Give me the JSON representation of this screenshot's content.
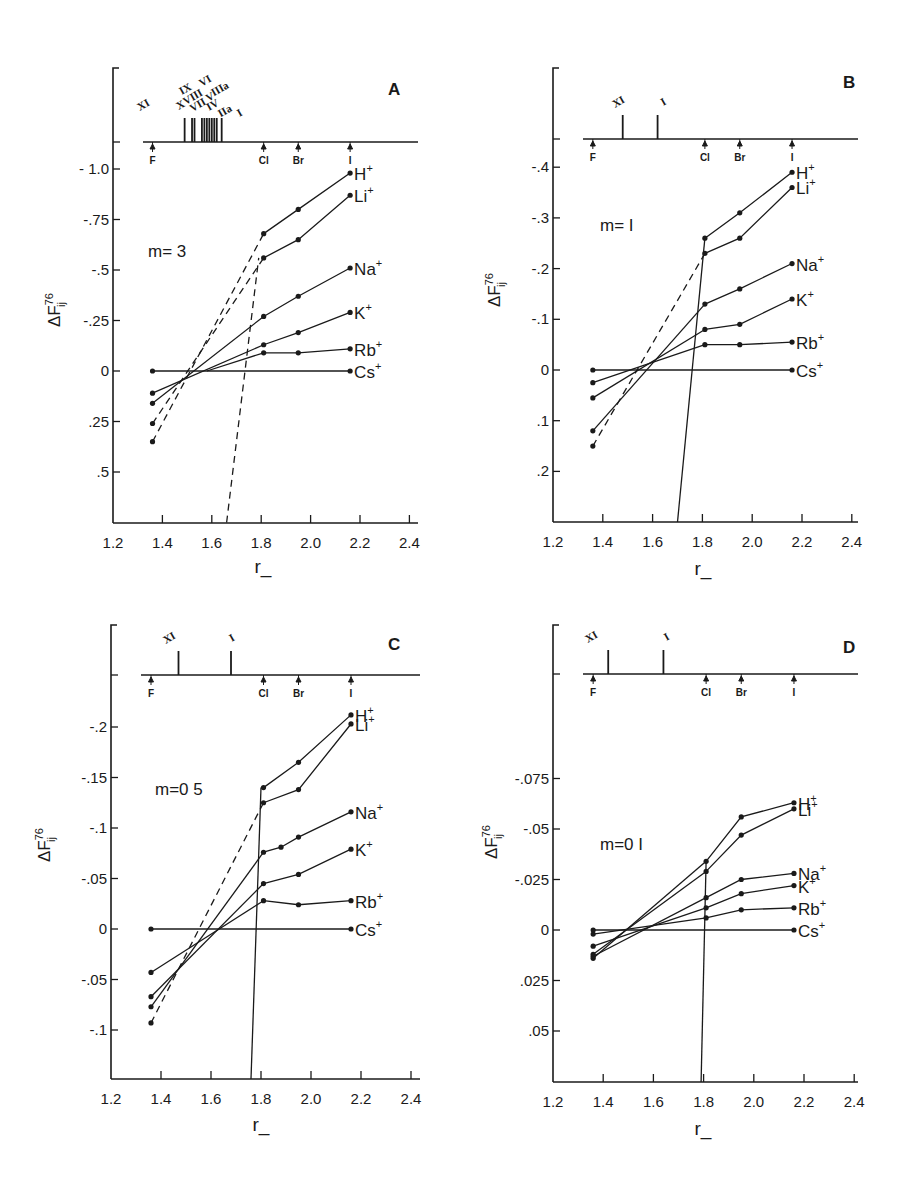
{
  "figure": {
    "title": "",
    "ylabel": "ΔF_ij^76",
    "xlabel": "r_"
  },
  "chart_data": [
    {
      "panel": "A",
      "type": "line",
      "annotation": "m= 3",
      "xlabel": "r_",
      "ylabel": "ΔF_ij^76",
      "x_ticks": [
        "1.2",
        "1.4",
        "1.6",
        "1.8",
        "2.0",
        "2.2",
        "2.4"
      ],
      "y_ticks": [
        {
          "v": -1.0,
          "label": "- 1.0"
        },
        {
          "v": -0.75,
          "label": "-.75"
        },
        {
          "v": -0.5,
          "label": "-.5"
        },
        {
          "v": -0.25,
          "label": "-.25"
        },
        {
          "v": 0,
          "label": "0"
        },
        {
          "v": 0.25,
          "label": ".25"
        },
        {
          "v": 0.5,
          "label": ".5"
        }
      ],
      "xlim": [
        1.2,
        2.46
      ],
      "ylim": [
        -1.0,
        0.75
      ],
      "y_inverted": true,
      "halide_markers": [
        {
          "label": "F",
          "x": 1.36
        },
        {
          "label": "Cl",
          "x": 1.81
        },
        {
          "label": "Br",
          "x": 1.95
        },
        {
          "label": "I",
          "x": 2.16
        }
      ],
      "roman_markers": [
        {
          "label": "XI",
          "x": 1.33,
          "pos": "low"
        },
        {
          "label": "X",
          "x": 1.48,
          "pos": "low"
        },
        {
          "label": "IX",
          "x": 1.5,
          "pos": "high"
        },
        {
          "label": "VIII",
          "x": 1.53,
          "pos": "mid"
        },
        {
          "label": "VII",
          "x": 1.55,
          "pos": "low"
        },
        {
          "label": "VI",
          "x": 1.58,
          "pos": "top"
        },
        {
          "label": "V",
          "x": 1.6,
          "pos": "mid"
        },
        {
          "label": "IV",
          "x": 1.61,
          "pos": "low"
        },
        {
          "label": "IIIa",
          "x": 1.64,
          "pos": "high"
        },
        {
          "label": "IIa",
          "x": 1.66,
          "pos": "low2"
        },
        {
          "label": "I",
          "x": 1.72,
          "pos": "lower"
        }
      ],
      "eisenman_lines_x": [
        1.49,
        1.52,
        1.53,
        1.56,
        1.57,
        1.58,
        1.59,
        1.6,
        1.61,
        1.62,
        1.64
      ],
      "series": [
        {
          "name": "H+",
          "ion": "H",
          "x": [
            1.81,
            1.95,
            2.16
          ],
          "y": [
            -0.68,
            -0.8,
            -0.98
          ],
          "ext_dashed": [
            [
              1.36,
              0.35
            ],
            [
              1.81,
              -0.68
            ]
          ]
        },
        {
          "name": "Li+",
          "ion": "Li",
          "x": [
            1.81,
            1.95,
            2.16
          ],
          "y": [
            -0.56,
            -0.65,
            -0.87
          ],
          "ext_dashed": [
            [
              1.36,
              0.26
            ],
            [
              1.81,
              -0.56
            ]
          ]
        },
        {
          "name": "Na+",
          "ion": "Na",
          "x": [
            1.81,
            1.95,
            2.16
          ],
          "y": [
            -0.27,
            -0.37,
            -0.51
          ],
          "ext_solid": [
            [
              1.36,
              0.16
            ],
            [
              1.81,
              -0.27
            ]
          ]
        },
        {
          "name": "K+",
          "ion": "K",
          "x": [
            1.81,
            1.95,
            2.16
          ],
          "y": [
            -0.13,
            -0.19,
            -0.29
          ],
          "ext_solid": [
            [
              1.36,
              0.11
            ],
            [
              1.81,
              -0.13
            ]
          ]
        },
        {
          "name": "Rb+",
          "ion": "Rb",
          "x": [
            1.81,
            1.95,
            2.16
          ],
          "y": [
            -0.09,
            -0.09,
            -0.11
          ],
          "ext_solid": [
            [
              1.58,
              0.0
            ],
            [
              1.81,
              -0.09
            ]
          ]
        },
        {
          "name": "Cs+",
          "ion": "Cs",
          "x": [
            1.36,
            2.16
          ],
          "y": [
            0,
            0
          ]
        }
      ],
      "cross_line": {
        "style": "dashed",
        "from": [
          1.66,
          0.75
        ],
        "to": [
          1.79,
          -0.56
        ]
      }
    },
    {
      "panel": "B",
      "type": "line",
      "annotation": "m= I",
      "xlabel": "r_",
      "ylabel": "ΔF_ij^76",
      "x_ticks": [
        "1.2",
        "1.4",
        "1.6",
        "1.8",
        "2.0",
        "2.2",
        "2.4"
      ],
      "y_ticks": [
        {
          "v": -0.4,
          "label": "-.4"
        },
        {
          "v": -0.3,
          "label": "-.3"
        },
        {
          "v": -0.2,
          "label": "-.2"
        },
        {
          "v": -0.1,
          "label": "-.1"
        },
        {
          "v": 0,
          "label": "0"
        },
        {
          "v": 0.1,
          "label": ".1"
        },
        {
          "v": 0.2,
          "label": ".2"
        }
      ],
      "xlim": [
        1.2,
        2.46
      ],
      "ylim": [
        -0.4,
        0.3
      ],
      "y_inverted": true,
      "halide_markers": [
        {
          "label": "F",
          "x": 1.36
        },
        {
          "label": "Cl",
          "x": 1.81
        },
        {
          "label": "Br",
          "x": 1.95
        },
        {
          "label": "I",
          "x": 2.16
        }
      ],
      "roman_markers": [
        {
          "label": "XI",
          "x": 1.47,
          "pos": "low"
        },
        {
          "label": "I",
          "x": 1.65,
          "pos": "low"
        }
      ],
      "eisenman_lines_x": [
        1.48,
        1.62
      ],
      "series": [
        {
          "name": "H+",
          "ion": "H",
          "x": [
            1.81,
            1.95,
            2.16
          ],
          "y": [
            -0.26,
            -0.31,
            -0.39
          ]
        },
        {
          "name": "Li+",
          "ion": "Li",
          "x": [
            1.81,
            1.95,
            2.16
          ],
          "y": [
            -0.23,
            -0.26,
            -0.36
          ],
          "ext_dashed": [
            [
              1.36,
              0.15
            ],
            [
              1.81,
              -0.23
            ]
          ]
        },
        {
          "name": "Na+",
          "ion": "Na",
          "x": [
            1.81,
            1.95,
            2.16
          ],
          "y": [
            -0.13,
            -0.16,
            -0.21
          ],
          "ext_solid": [
            [
              1.36,
              0.12
            ],
            [
              1.81,
              -0.13
            ]
          ]
        },
        {
          "name": "K+",
          "ion": "K",
          "x": [
            1.81,
            1.95,
            2.16
          ],
          "y": [
            -0.08,
            -0.09,
            -0.14
          ],
          "ext_solid": [
            [
              1.36,
              0.055
            ],
            [
              1.81,
              -0.08
            ]
          ]
        },
        {
          "name": "Rb+",
          "ion": "Rb",
          "x": [
            1.81,
            1.95,
            2.16
          ],
          "y": [
            -0.05,
            -0.05,
            -0.055
          ],
          "ext_solid": [
            [
              1.36,
              0.025
            ],
            [
              1.81,
              -0.05
            ]
          ]
        },
        {
          "name": "Cs+",
          "ion": "Cs",
          "x": [
            1.36,
            2.16
          ],
          "y": [
            0,
            0
          ]
        }
      ],
      "cross_line": {
        "style": "solid",
        "from": [
          1.7,
          0.3
        ],
        "to": [
          1.81,
          -0.26
        ]
      }
    },
    {
      "panel": "C",
      "type": "line",
      "annotation": "m=0 5",
      "xlabel": "r_",
      "ylabel": "ΔF_ij^76",
      "x_ticks": [
        "1.2",
        "1.4",
        "1.6",
        "1.8",
        "2.0",
        "2.2",
        "2.4"
      ],
      "y_ticks": [
        {
          "v": -0.2,
          "label": "-.2"
        },
        {
          "v": -0.15,
          "label": "-.15"
        },
        {
          "v": -0.1,
          "label": "-.1"
        },
        {
          "v": -0.05,
          "label": "-.05"
        },
        {
          "v": 0,
          "label": "0"
        },
        {
          "v": 0.05,
          "label": "-.05"
        },
        {
          "v": 0.1,
          "label": "-.1"
        }
      ],
      "xlim": [
        1.2,
        2.46
      ],
      "ylim": [
        -0.2,
        0.15
      ],
      "y_inverted": true,
      "halide_markers": [
        {
          "label": "F",
          "x": 1.36
        },
        {
          "label": "Cl",
          "x": 1.81
        },
        {
          "label": "Br",
          "x": 1.95
        },
        {
          "label": "I",
          "x": 2.16
        }
      ],
      "roman_markers": [
        {
          "label": "XI",
          "x": 1.44,
          "pos": "low"
        },
        {
          "label": "I",
          "x": 1.69,
          "pos": "low"
        }
      ],
      "eisenman_lines_x": [
        1.47,
        1.68
      ],
      "series": [
        {
          "name": "H+",
          "ion": "H",
          "x": [
            1.81,
            1.95,
            2.16
          ],
          "y": [
            -0.14,
            -0.165,
            -0.212
          ]
        },
        {
          "name": "Li+",
          "ion": "Li",
          "x": [
            1.81,
            1.95,
            2.16
          ],
          "y": [
            -0.125,
            -0.138,
            -0.203
          ],
          "ext_dashed": [
            [
              1.36,
              0.093
            ],
            [
              1.81,
              -0.125
            ]
          ]
        },
        {
          "name": "Na+",
          "ion": "Na",
          "x": [
            1.81,
            1.88,
            1.95,
            2.16
          ],
          "y": [
            -0.076,
            -0.081,
            -0.091,
            -0.116
          ],
          "ext_solid": [
            [
              1.36,
              0.077
            ],
            [
              1.81,
              -0.076
            ]
          ]
        },
        {
          "name": "K+",
          "ion": "K",
          "x": [
            1.81,
            1.95,
            2.16
          ],
          "y": [
            -0.045,
            -0.054,
            -0.079
          ],
          "ext_solid": [
            [
              1.36,
              0.067
            ],
            [
              1.81,
              -0.045
            ]
          ]
        },
        {
          "name": "Rb+",
          "ion": "Rb",
          "x": [
            1.81,
            1.95,
            2.16
          ],
          "y": [
            -0.028,
            -0.024,
            -0.028
          ],
          "ext_solid": [
            [
              1.36,
              0.043
            ],
            [
              1.81,
              -0.028
            ]
          ]
        },
        {
          "name": "Cs+",
          "ion": "Cs",
          "x": [
            1.36,
            2.16
          ],
          "y": [
            0,
            0
          ]
        }
      ],
      "cross_line": {
        "style": "solid",
        "from": [
          1.76,
          0.15
        ],
        "to": [
          1.8,
          -0.14
        ]
      }
    },
    {
      "panel": "D",
      "type": "line",
      "annotation": "m=0 I",
      "xlabel": "r_",
      "ylabel": "ΔF_ij^76",
      "x_ticks": [
        "1.2",
        "1.4",
        "1.6",
        "1.8",
        "2.0",
        "2.2",
        "2.4"
      ],
      "y_ticks": [
        {
          "v": -0.075,
          "label": "-.075"
        },
        {
          "v": -0.05,
          "label": "-.05"
        },
        {
          "v": -0.025,
          "label": "-.025"
        },
        {
          "v": 0,
          "label": "0"
        },
        {
          "v": 0.025,
          "label": ".025"
        },
        {
          "v": 0.05,
          "label": ".05"
        }
      ],
      "xlim": [
        1.2,
        2.46
      ],
      "ylim": [
        -0.1,
        0.075
      ],
      "y_inverted": true,
      "halide_markers": [
        {
          "label": "F",
          "x": 1.36
        },
        {
          "label": "Cl",
          "x": 1.81
        },
        {
          "label": "Br",
          "x": 1.95
        },
        {
          "label": "I",
          "x": 2.16
        }
      ],
      "roman_markers": [
        {
          "label": "XI",
          "x": 1.36,
          "pos": "low"
        },
        {
          "label": "I",
          "x": 1.66,
          "pos": "low"
        }
      ],
      "eisenman_lines_x": [
        1.42,
        1.64
      ],
      "series": [
        {
          "name": "H+",
          "ion": "H",
          "x": [
            1.81,
            1.95,
            2.16
          ],
          "y": [
            -0.034,
            -0.056,
            -0.063
          ],
          "ext_solid": [
            [
              1.36,
              0.014
            ],
            [
              1.81,
              -0.034
            ]
          ]
        },
        {
          "name": "Li+",
          "ion": "Li",
          "x": [
            1.81,
            1.95,
            2.16
          ],
          "y": [
            -0.029,
            -0.047,
            -0.06
          ],
          "ext_solid": [
            [
              1.36,
              0.012
            ],
            [
              1.81,
              -0.029
            ]
          ]
        },
        {
          "name": "Na+",
          "ion": "Na",
          "x": [
            1.81,
            1.95,
            2.16
          ],
          "y": [
            -0.016,
            -0.025,
            -0.028
          ],
          "ext_solid": [
            [
              1.36,
              0.013
            ],
            [
              1.81,
              -0.016
            ]
          ]
        },
        {
          "name": "K+",
          "ion": "K",
          "x": [
            1.81,
            1.95,
            2.16
          ],
          "y": [
            -0.011,
            -0.018,
            -0.022
          ],
          "ext_solid": [
            [
              1.36,
              0.008
            ],
            [
              1.81,
              -0.011
            ]
          ]
        },
        {
          "name": "Rb+",
          "ion": "Rb",
          "x": [
            1.81,
            1.95,
            2.16
          ],
          "y": [
            -0.006,
            -0.01,
            -0.011
          ],
          "ext_solid": [
            [
              1.36,
              0.002
            ],
            [
              1.81,
              -0.006
            ]
          ]
        },
        {
          "name": "Cs+",
          "ion": "Cs",
          "x": [
            1.36,
            2.16
          ],
          "y": [
            0,
            0
          ]
        }
      ],
      "cross_line": {
        "style": "solid",
        "from": [
          1.79,
          0.1
        ],
        "to": [
          1.81,
          -0.034
        ]
      }
    }
  ]
}
